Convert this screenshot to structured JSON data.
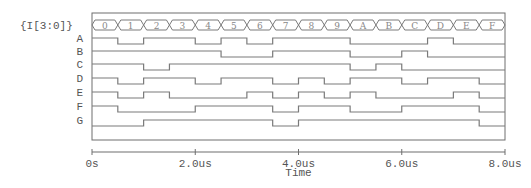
{
  "diagram": {
    "type": "digital-waveform",
    "bus": {
      "label": "{I[3:0]}",
      "values": [
        "0",
        "1",
        "2",
        "3",
        "4",
        "5",
        "6",
        "7",
        "8",
        "9",
        "A",
        "B",
        "C",
        "D",
        "E",
        "F"
      ]
    },
    "signals": [
      {
        "name": "A",
        "levels": [
          1,
          0,
          1,
          1,
          0,
          1,
          0,
          1,
          1,
          1,
          0,
          0,
          0,
          1,
          0,
          0
        ]
      },
      {
        "name": "B",
        "levels": [
          1,
          1,
          1,
          1,
          1,
          0,
          0,
          1,
          1,
          1,
          0,
          0,
          1,
          0,
          0,
          0
        ]
      },
      {
        "name": "C",
        "levels": [
          1,
          1,
          0,
          1,
          1,
          1,
          1,
          1,
          1,
          1,
          0,
          1,
          0,
          0,
          0,
          0
        ]
      },
      {
        "name": "D",
        "levels": [
          1,
          0,
          1,
          1,
          0,
          1,
          1,
          0,
          1,
          0,
          1,
          1,
          0,
          1,
          1,
          0
        ]
      },
      {
        "name": "E",
        "levels": [
          1,
          0,
          1,
          0,
          0,
          0,
          1,
          0,
          1,
          0,
          1,
          0,
          0,
          0,
          1,
          0
        ]
      },
      {
        "name": "F",
        "levels": [
          1,
          0,
          0,
          0,
          1,
          1,
          1,
          0,
          1,
          1,
          0,
          0,
          1,
          1,
          1,
          0
        ]
      },
      {
        "name": "G",
        "levels": [
          0,
          0,
          1,
          1,
          1,
          1,
          1,
          0,
          1,
          1,
          1,
          1,
          1,
          1,
          1,
          0
        ]
      }
    ],
    "x_axis": {
      "label": "Time",
      "ticks": [
        "0s",
        "2.0us",
        "4.0us",
        "6.0us",
        "8.0us"
      ],
      "range_us": [
        0,
        8
      ]
    },
    "colors": {
      "trace": "#7a7a7a",
      "frame": "#6e6e6e",
      "text": "#555555"
    }
  }
}
